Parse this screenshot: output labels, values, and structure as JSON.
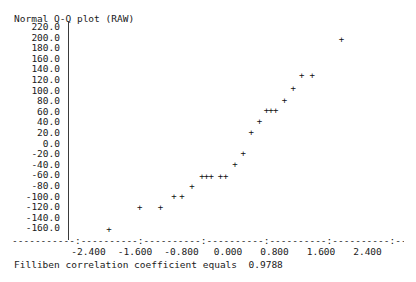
{
  "chart_data": {
    "type": "scatter",
    "title": "Normal Q-Q plot (RAW)",
    "xlabel": "",
    "ylabel": "",
    "grid": false,
    "legend": null,
    "xlim": [
      -2.8,
      2.8
    ],
    "ylim": [
      -170.0,
      228.0
    ],
    "xticks": [
      "-2.400",
      "-1.600",
      "-0.800",
      "0.000",
      "0.800",
      "1.600",
      "2.400"
    ],
    "xtick_values": [
      -2.4,
      -1.6,
      -0.8,
      0.0,
      0.8,
      1.6,
      2.4
    ],
    "yticks": [
      "220.0",
      "200.0",
      "180.0",
      "160.0",
      "140.0",
      "120.0",
      "100.0",
      "80.0",
      "60.0",
      "40.0",
      "20.0",
      "0.0",
      "-20.0",
      "-40.0",
      "-60.0",
      "-80.0",
      "-100.0",
      "-120.0",
      "-140.0",
      "-160.0"
    ],
    "ytick_values": [
      220,
      200,
      180,
      160,
      140,
      120,
      100,
      80,
      60,
      40,
      20,
      0,
      -20,
      -40,
      -60,
      -80,
      -100,
      -120,
      -140,
      -160
    ],
    "marker": "+",
    "points": [
      {
        "x": -2.05,
        "y": -162.0
      },
      {
        "x": -1.52,
        "y": -120.0
      },
      {
        "x": -1.16,
        "y": -120.0
      },
      {
        "x": -0.93,
        "y": -100.0
      },
      {
        "x": -0.79,
        "y": -100.0
      },
      {
        "x": -0.62,
        "y": -82.0
      },
      {
        "x": -0.45,
        "y": -62.0
      },
      {
        "x": -0.37,
        "y": -62.0
      },
      {
        "x": -0.29,
        "y": -62.0
      },
      {
        "x": -0.13,
        "y": -62.0
      },
      {
        "x": -0.04,
        "y": -62.0
      },
      {
        "x": 0.12,
        "y": -40.0
      },
      {
        "x": 0.26,
        "y": -18.0
      },
      {
        "x": 0.4,
        "y": 20.0
      },
      {
        "x": 0.54,
        "y": 42.0
      },
      {
        "x": 0.66,
        "y": 62.0
      },
      {
        "x": 0.74,
        "y": 62.0
      },
      {
        "x": 0.82,
        "y": 62.0
      },
      {
        "x": 0.97,
        "y": 82.0
      },
      {
        "x": 1.12,
        "y": 104.0
      },
      {
        "x": 1.27,
        "y": 128.0
      },
      {
        "x": 1.45,
        "y": 128.0
      },
      {
        "x": 1.95,
        "y": 197.0
      }
    ]
  },
  "axis": {
    "x_axis_glyphs": "-----------:----------:----------:----------:----------:----------:----------:"
  },
  "caption": {
    "text": "Filliben correlation coefficient equals  0.9788"
  }
}
